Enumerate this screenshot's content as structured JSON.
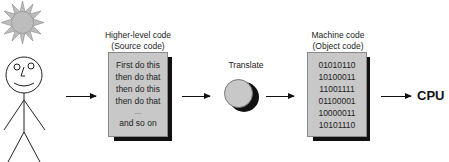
{
  "diagram": {
    "type": "flow",
    "source_block": {
      "title_line1": "Higher-level code",
      "title_line2": "(Source code)",
      "lines": [
        "First do this",
        "then do that",
        "then do this",
        "then do that",
        "....",
        "and so on"
      ]
    },
    "translate": {
      "label": "Translate"
    },
    "object_block": {
      "title_line1": "Machine code",
      "title_line2": "(Object code)",
      "lines": [
        "01010110",
        "10100011",
        "11001111",
        "01100001",
        "10000011",
        "10101110"
      ]
    },
    "cpu": {
      "label": "CPU"
    },
    "colors": {
      "box_fill": "#c8c8c8",
      "shadow": "#111111",
      "sun_fill": "#bdbdbd"
    }
  }
}
